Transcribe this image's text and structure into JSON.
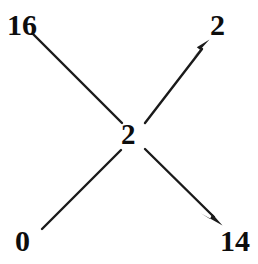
{
  "diagram": {
    "type": "node-flow",
    "background_color": "#ffffff",
    "stroke_color": "#1a1a1a",
    "text_color": "#0d0d0d",
    "stroke_width": 2.4,
    "center_node": {
      "label": "2",
      "x": 133,
      "y": 135
    },
    "inputs": [
      {
        "id": "in-16",
        "label": "16",
        "x": 24,
        "y": 24,
        "arrow": false
      },
      {
        "id": "in-0",
        "label": "0",
        "x": 27,
        "y": 239,
        "arrow": false
      }
    ],
    "outputs": [
      {
        "id": "out-2",
        "label": "2",
        "x": 222,
        "y": 24,
        "arrow": true
      },
      {
        "id": "out-14",
        "label": "14",
        "x": 236,
        "y": 240,
        "arrow": true
      }
    ],
    "edges": [
      {
        "id": "edge-in-16",
        "from": "in-16",
        "to": "center",
        "x1": 33,
        "y1": 34,
        "x2": 122,
        "y2": 123,
        "arrowhead": false
      },
      {
        "id": "edge-in-0",
        "from": "in-0",
        "to": "center",
        "x1": 42,
        "y1": 229,
        "x2": 121,
        "y2": 150,
        "arrowhead": false
      },
      {
        "id": "edge-out-2",
        "from": "center",
        "to": "out-2",
        "x1": 145,
        "y1": 123,
        "x2": 208,
        "y2": 42,
        "arrowhead": true
      },
      {
        "id": "edge-out-14",
        "from": "center",
        "to": "out-14",
        "x1": 145,
        "y1": 149,
        "x2": 221,
        "y2": 224,
        "arrowhead": true
      }
    ]
  }
}
